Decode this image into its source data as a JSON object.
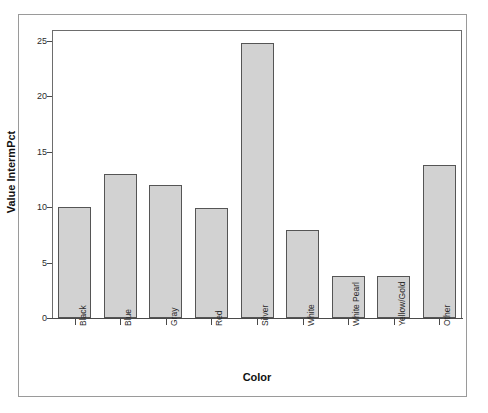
{
  "chart_data": {
    "type": "bar",
    "title": "",
    "xlabel": "Color",
    "ylabel": "Value IntermPct",
    "categories": [
      "Black",
      "Blue",
      "Gray",
      "Red",
      "Silver",
      "White",
      "White Pearl",
      "Yellow/Gold",
      "Other"
    ],
    "values": [
      10.0,
      13.0,
      12.0,
      9.9,
      24.8,
      7.9,
      3.8,
      3.8,
      13.8
    ],
    "ylim": [
      0,
      26
    ],
    "ytick_labels": [
      "0",
      "5",
      "10",
      "15",
      "20",
      "25"
    ],
    "ytick_values": [
      0,
      5,
      10,
      15,
      20,
      25
    ],
    "grid": false,
    "legend": "none",
    "bar_fill_color": "#d2d2d2",
    "bar_border_color": "#555555",
    "axis_color": "#4a4a4a",
    "frame_color": "#9a9a9a",
    "background_color": "#ffffff"
  }
}
